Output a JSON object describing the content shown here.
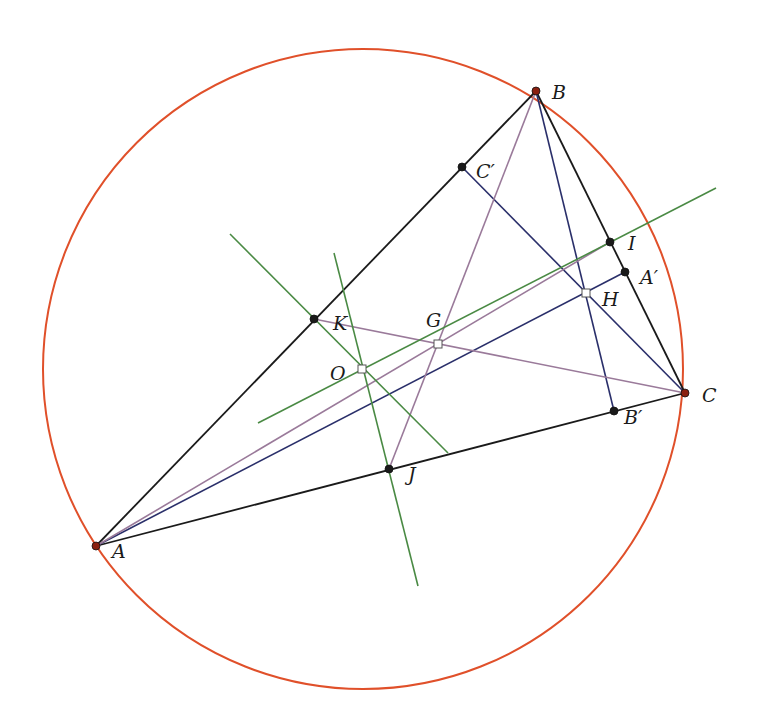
{
  "diagram": {
    "colors": {
      "circle": "#e0502a",
      "triangle": "#1a1a1a",
      "altitude": "#2a2f6a",
      "median": "#9a7a9a",
      "bisector": "#4a8a44",
      "point": "#1a1a1a",
      "vertex_point": "#8a2010"
    },
    "circumcircle": {
      "cx": 363,
      "cy": 369,
      "r": 320
    },
    "points": {
      "A": {
        "x": 96,
        "y": 546,
        "label": "A",
        "lx": 112,
        "ly": 558,
        "style": "vertex"
      },
      "B": {
        "x": 536,
        "y": 91,
        "label": "B",
        "lx": 552,
        "ly": 99,
        "style": "vertex"
      },
      "C": {
        "x": 685,
        "y": 393,
        "label": "C",
        "lx": 702,
        "ly": 402,
        "style": "vertex"
      },
      "Cp": {
        "x": 462,
        "y": 167,
        "label": "C′",
        "lx": 476,
        "ly": 178,
        "style": "dot"
      },
      "Ap": {
        "x": 625,
        "y": 272,
        "label": "A′",
        "lx": 640,
        "ly": 284,
        "style": "dot"
      },
      "Bp": {
        "x": 614,
        "y": 411,
        "label": "B′",
        "lx": 624,
        "ly": 424,
        "style": "dot"
      },
      "H": {
        "x": 586,
        "y": 293,
        "label": "H",
        "lx": 602,
        "ly": 306,
        "style": "square"
      },
      "G": {
        "x": 438,
        "y": 344,
        "label": "G",
        "lx": 426,
        "ly": 327,
        "style": "square"
      },
      "O": {
        "x": 362,
        "y": 369,
        "label": "O",
        "lx": 330,
        "ly": 380,
        "style": "square"
      },
      "K": {
        "x": 314,
        "y": 319,
        "label": "K",
        "lx": 333,
        "ly": 330,
        "style": "dot"
      },
      "J": {
        "x": 389,
        "y": 469,
        "label": "J",
        "lx": 408,
        "ly": 481,
        "style": "dot"
      },
      "I": {
        "x": 610,
        "y": 242,
        "label": "I",
        "lx": 628,
        "ly": 250,
        "style": "dot"
      }
    },
    "segments": [
      {
        "name": "side-ab",
        "x1": 96,
        "y1": 546,
        "x2": 536,
        "y2": 91,
        "kind": "triangle"
      },
      {
        "name": "side-bc",
        "x1": 536,
        "y1": 91,
        "x2": 685,
        "y2": 393,
        "kind": "triangle"
      },
      {
        "name": "side-ca",
        "x1": 685,
        "y1": 393,
        "x2": 96,
        "y2": 546,
        "kind": "triangle"
      },
      {
        "name": "altitude-a",
        "x1": 96,
        "y1": 546,
        "x2": 625,
        "y2": 272,
        "kind": "altitude"
      },
      {
        "name": "altitude-b",
        "x1": 536,
        "y1": 91,
        "x2": 614,
        "y2": 411,
        "kind": "altitude"
      },
      {
        "name": "altitude-c",
        "x1": 685,
        "y1": 393,
        "x2": 462,
        "y2": 167,
        "kind": "altitude"
      },
      {
        "name": "median-a",
        "x1": 96,
        "y1": 546,
        "x2": 610,
        "y2": 242,
        "kind": "median"
      },
      {
        "name": "median-b",
        "x1": 536,
        "y1": 91,
        "x2": 389,
        "y2": 469,
        "kind": "median"
      },
      {
        "name": "median-c",
        "x1": 685,
        "y1": 393,
        "x2": 314,
        "y2": 319,
        "kind": "median"
      },
      {
        "name": "euler-line",
        "x1": 258,
        "y1": 423,
        "x2": 716,
        "y2": 188,
        "kind": "bisector"
      },
      {
        "name": "perp-bisector-ab",
        "x1": 230,
        "y1": 234,
        "x2": 448,
        "y2": 453,
        "kind": "bisector"
      },
      {
        "name": "perp-bisector-ca",
        "x1": 334,
        "y1": 253,
        "x2": 418,
        "y2": 586,
        "kind": "bisector"
      }
    ]
  }
}
